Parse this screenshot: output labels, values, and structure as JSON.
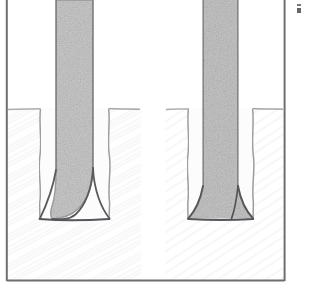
{
  "figure": {
    "medium": "scanned line drawing with stipple shading",
    "panel_count": 2,
    "caption": ""
  },
  "frame": {
    "visible_borders": [
      "left",
      "right",
      "bottom"
    ],
    "top_border_visible": false,
    "left_x": 6,
    "right_x": 285,
    "bottom_y": 281,
    "stroke_color": "#6f6f72",
    "stroke_width_px": 2,
    "fill_color": "#ffffff"
  },
  "background": {
    "paper_color": "#ffffff",
    "wood_grain_color": "#dcdcdc",
    "grain_direction": "diagonal",
    "grain_opacity": 0.45
  },
  "separator": {
    "name": "center-gutter",
    "x": 141,
    "width": 24,
    "color": "#ffffff"
  },
  "artifact": {
    "name": "scan-speck",
    "x": 297,
    "y": 4,
    "color": "#46464a"
  },
  "panels": [
    {
      "id": "left-panel",
      "label": "Loose / gapped tenon",
      "tenon": {
        "x": 56,
        "width": 37,
        "top_y": 0,
        "tip_y": 212,
        "fill_color": "#c9c9c9",
        "edge_color": "#8a8a8e",
        "seated": false,
        "tip_shape": "rounded-taper"
      },
      "mortise": {
        "left_wall_x": 40,
        "right_wall_x": 109,
        "mouth_y": 108,
        "floor_y": 219,
        "wall_color": "#9a9a9e",
        "wall_style": "wavy",
        "cavity_color": "#fafafa"
      },
      "fillets": {
        "description": "concave curves flaring from tenon tip to mortise floor",
        "color": "#5d5d61",
        "gap_visible": true
      },
      "workpiece": {
        "top_y": 108,
        "fill_color": "#f2f2f2"
      }
    },
    {
      "id": "right-panel",
      "label": "Seated tenon",
      "tenon": {
        "x": 203,
        "width": 35,
        "top_y": 0,
        "tip_y": 219,
        "fill_color": "#c4c4c4",
        "edge_color": "#8a8a8e",
        "seated": true,
        "tip_shape": "flared-to-floor"
      },
      "mortise": {
        "left_wall_x": 188,
        "right_wall_x": 253,
        "mouth_y": 108,
        "floor_y": 219,
        "wall_color": "#9a9a9e",
        "wall_style": "wavy",
        "cavity_color": "#fafafa"
      },
      "fillets": {
        "description": "concave curves flaring from tenon sides to mortise floor",
        "color": "#5d5d61",
        "gap_visible": false
      },
      "workpiece": {
        "top_y": 108,
        "fill_color": "#f2f2f2"
      }
    }
  ]
}
